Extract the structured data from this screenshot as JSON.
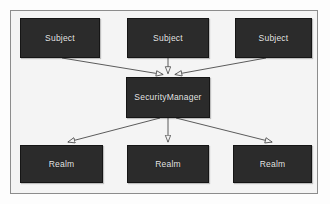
{
  "diagram": {
    "type": "uml-class-relationship",
    "title": "",
    "frame": {
      "x": 10,
      "y": 10,
      "width": 308,
      "height": 184,
      "border_color": "#8c8c8c",
      "background_color": "#f4f4f4"
    },
    "style": {
      "node_fill": "#2b2b2b",
      "node_border": "#151515",
      "node_text_color": "#e8e8e8",
      "connector_color": "#4a4a4a",
      "arrowhead": "hollow-triangle"
    },
    "nodes": [
      {
        "id": "subject-left",
        "label": "Subject",
        "x": 20,
        "y": 18,
        "width": 80,
        "height": 40,
        "row": "top"
      },
      {
        "id": "subject-center",
        "label": "Subject",
        "x": 127,
        "y": 18,
        "width": 82,
        "height": 40,
        "row": "top"
      },
      {
        "id": "subject-right",
        "label": "Subject",
        "x": 235,
        "y": 18,
        "width": 77,
        "height": 40,
        "row": "top"
      },
      {
        "id": "security-manager",
        "label": "SecurityManager",
        "x": 126,
        "y": 77,
        "width": 84,
        "height": 41,
        "row": "middle"
      },
      {
        "id": "realm-left",
        "label": "Realm",
        "x": 20,
        "y": 145,
        "width": 83,
        "height": 38,
        "row": "bottom"
      },
      {
        "id": "realm-center",
        "label": "Realm",
        "x": 127,
        "y": 145,
        "width": 82,
        "height": 38,
        "row": "bottom"
      },
      {
        "id": "realm-right",
        "label": "Realm",
        "x": 233,
        "y": 145,
        "width": 79,
        "height": 38,
        "row": "bottom"
      }
    ],
    "edges": [
      {
        "id": "edge-subject-left-to-sm",
        "from": "subject-left",
        "to": "security-manager",
        "arrow_at": "to"
      },
      {
        "id": "edge-subject-center-to-sm",
        "from": "subject-center",
        "to": "security-manager",
        "arrow_at": "to"
      },
      {
        "id": "edge-subject-right-to-sm",
        "from": "subject-right",
        "to": "security-manager",
        "arrow_at": "to"
      },
      {
        "id": "edge-sm-to-realm-left",
        "from": "security-manager",
        "to": "realm-left",
        "arrow_at": "to"
      },
      {
        "id": "edge-sm-to-realm-center",
        "from": "security-manager",
        "to": "realm-center",
        "arrow_at": "to"
      },
      {
        "id": "edge-sm-to-realm-right",
        "from": "security-manager",
        "to": "realm-right",
        "arrow_at": "to"
      }
    ]
  }
}
